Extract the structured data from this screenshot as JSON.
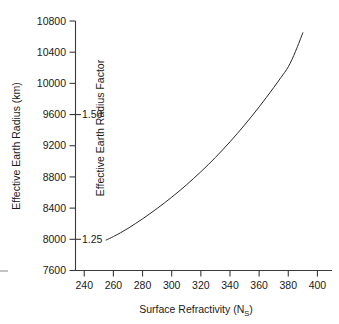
{
  "chart_data": {
    "type": "line",
    "title": "",
    "xlabel": "Surface Refractivity (N_S)",
    "xlabel_main": "Surface Refractivity (N",
    "xlabel_sub": "S",
    "xlabel_tail": ")",
    "ylabel": "Effective Earth Radius (km)",
    "secondary_ylabel": "Effective Earth Radius Factor",
    "xlim": [
      234,
      410
    ],
    "ylim": [
      7600,
      10800
    ],
    "xticks": [
      240,
      260,
      280,
      300,
      320,
      340,
      360,
      380,
      400
    ],
    "xticklabels": [
      "240",
      "260",
      "280",
      "300",
      "320",
      "340",
      "360",
      "380",
      "400"
    ],
    "yticks": [
      7600,
      8000,
      8400,
      8800,
      9200,
      9600,
      10000,
      10400,
      10800
    ],
    "yticklabels": [
      "7600",
      "8000",
      "8400",
      "8800",
      "9200",
      "9600",
      "10000",
      "10400",
      "10800"
    ],
    "secondary_yticks": [
      8000,
      9600
    ],
    "secondary_yticklabels": [
      "1.25",
      "1.50"
    ],
    "grid": false,
    "legend": "none",
    "series": [
      {
        "name": "Effective Earth Radius vs Surface Refractivity",
        "x": [
          255,
          260,
          265,
          270,
          275,
          280,
          285,
          290,
          295,
          300,
          305,
          310,
          315,
          320,
          325,
          330,
          335,
          340,
          345,
          350,
          355,
          360,
          365,
          370,
          375,
          380,
          385,
          390
        ],
        "y": [
          7990,
          8035,
          8085,
          8140,
          8200,
          8262,
          8328,
          8396,
          8466,
          8540,
          8616,
          8696,
          8780,
          8866,
          8956,
          9050,
          9148,
          9250,
          9356,
          9466,
          9580,
          9698,
          9820,
          9946,
          10076,
          10212,
          10412,
          10650
        ]
      }
    ]
  },
  "axes": {
    "x_axis_name": "x-axis",
    "y_axis_name": "y-axis",
    "secondary_axis_name": "secondary-y-axis"
  }
}
